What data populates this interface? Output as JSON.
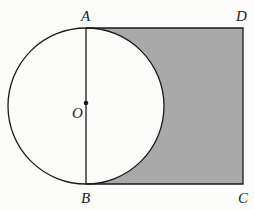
{
  "diagram": {
    "colors": {
      "shade": "#a9a9a9",
      "stroke": "#1a1a1a",
      "background": "#fbfbf9"
    },
    "points": {
      "A": {
        "label": "A",
        "x": 86,
        "y": 28
      },
      "B": {
        "label": "B",
        "x": 86,
        "y": 184
      },
      "C": {
        "label": "C",
        "x": 243,
        "y": 184
      },
      "D": {
        "label": "D",
        "x": 243,
        "y": 28
      },
      "O": {
        "label": "O",
        "x": 86,
        "y": 106
      }
    },
    "circle": {
      "center": "O",
      "radius": 78
    }
  }
}
